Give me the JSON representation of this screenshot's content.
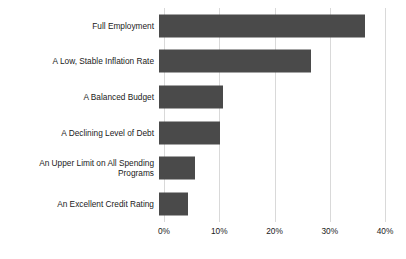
{
  "chart_data": {
    "type": "bar",
    "orientation": "horizontal",
    "title": "",
    "subtitle": "",
    "xlabel": "",
    "ylabel": "",
    "xlim": [
      0,
      40
    ],
    "grid": true,
    "legend": false,
    "legend_position": "none",
    "bar_color": "#4a4a4a",
    "gridline_color": "#d9d9d9",
    "text_color": "#1a1a1a",
    "background_color": "#ffffff",
    "tick_suffix": "%",
    "categories": [
      "Full Employment",
      "A Low, Stable Inflation Rate",
      "A Balanced Budget",
      "A Declining Level of Debt",
      "An Upper Limit on All Spending\nPrograms",
      "An Excellent Credit Rating"
    ],
    "values": [
      37.3,
      27.5,
      11.5,
      11.1,
      6.5,
      5.3
    ],
    "xticks": [
      0,
      10,
      20,
      30,
      40
    ],
    "xticklabels": [
      "0%",
      "10%",
      "20%",
      "30%",
      "40%"
    ]
  }
}
